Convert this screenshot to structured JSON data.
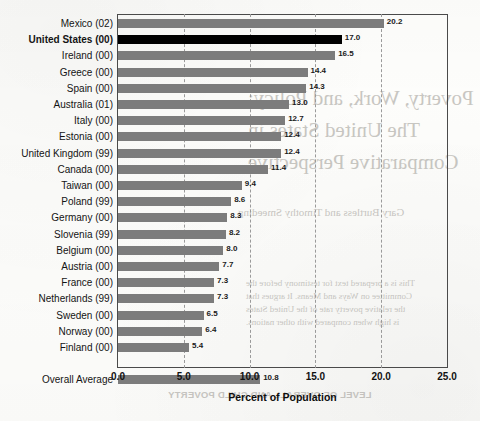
{
  "chart_data": {
    "type": "bar",
    "orientation": "horizontal",
    "title": "",
    "xlabel": "Percent of Population",
    "ylabel": "",
    "xlim": [
      0.0,
      25.0
    ],
    "xticks": [
      "0.0",
      "5.0",
      "10.0",
      "15.0",
      "20.0",
      "25.0"
    ],
    "xtick_values": [
      0.0,
      5.0,
      10.0,
      15.0,
      20.0,
      25.0
    ],
    "grid": "vertical-dashed",
    "legend": "none",
    "categories": [
      "Mexico (02)",
      "United States (00)",
      "Ireland (00)",
      "Greece (00)",
      "Spain (00)",
      "Australia (01)",
      "Italy (00)",
      "Estonia (00)",
      "United Kingdom (99)",
      "Canada (00)",
      "Taiwan (00)",
      "Poland (99)",
      "Germany (00)",
      "Slovenia (99)",
      "Belgium (00)",
      "Austria (00)",
      "France (00)",
      "Netherlands (99)",
      "Sweden (00)",
      "Norway (00)",
      "Finland (00)",
      "Overall Average"
    ],
    "values": [
      20.2,
      17.0,
      16.5,
      14.4,
      14.3,
      13.0,
      12.7,
      12.4,
      12.4,
      11.4,
      9.4,
      8.6,
      8.3,
      8.2,
      8.0,
      7.7,
      7.3,
      7.3,
      6.5,
      6.4,
      5.4,
      10.8
    ],
    "value_labels": [
      "20.2",
      "17.0",
      "16.5",
      "14.4",
      "14.3",
      "13.0",
      "12.7",
      "12.4",
      "12.4",
      "11.4",
      "9.4",
      "8.6",
      "8.3",
      "8.2",
      "8.0",
      "7.7",
      "7.3",
      "7.3",
      "6.5",
      "6.4",
      "5.4",
      "10.8"
    ],
    "highlighted_category": "United States (00)",
    "separator_before": "Overall Average",
    "colors": {
      "bar": "#7c7c7c",
      "bar_highlight": "#000000",
      "axis": "#4a4a4a",
      "grid": "#9a9a9a",
      "text": "#141414"
    }
  },
  "bleed_through": {
    "title_line_1": "Poverty, Work, and Policy:",
    "title_line_2": "The United States in",
    "title_line_3": "Comparative Perspective",
    "author": "Gary Burtless and Timothy Smeeding",
    "paragraph_line_1": "This is a prepared text for testimony before the",
    "paragraph_line_2": "Committee on Ways and Means. It argues that",
    "paragraph_line_3": "the relative poverty rate of the United States",
    "paragraph_line_4": "is high when compared with other nations.",
    "footer": "LEVEL OF OVERALL AND CHILD POVERTY"
  }
}
